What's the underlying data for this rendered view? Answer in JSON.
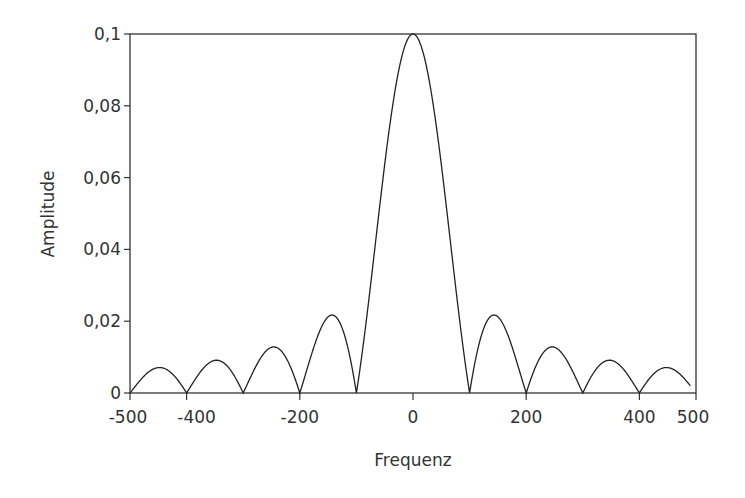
{
  "chart_data": {
    "type": "line",
    "title": "",
    "xlabel": "Frequenz",
    "ylabel": "Amplitude",
    "xlim": [
      -500,
      500
    ],
    "ylim": [
      0,
      0.1
    ],
    "grid": false,
    "legend": null,
    "x_ticks": [
      -500,
      -400,
      -200,
      0,
      200,
      400,
      500
    ],
    "x_tick_labels": [
      "-500",
      "-400",
      "-200",
      "0",
      "200",
      "400",
      "500"
    ],
    "y_ticks": [
      0,
      0.02,
      0.04,
      0.06,
      0.08,
      0.1
    ],
    "y_tick_labels": [
      "0",
      "0,02",
      "0,04",
      "0,06",
      "0,08",
      "0,1"
    ],
    "function": "0.1*|sinc(f/100)|",
    "zeros": [
      -400,
      -300,
      -200,
      -100,
      100,
      200,
      300,
      400
    ],
    "series": [
      {
        "name": "Amplitude",
        "x": [
          -500,
          -450,
          -400,
          -350,
          -300,
          -250,
          -200,
          -143,
          -100,
          -50,
          0,
          50,
          100,
          143,
          200,
          250,
          300,
          350,
          400,
          450,
          490
        ],
        "values": [
          0,
          0.0105,
          0,
          0.0118,
          0,
          0.0145,
          0,
          0.023,
          0,
          0.0636,
          0.1,
          0.0636,
          0,
          0.023,
          0,
          0.0145,
          0,
          0.0118,
          0,
          0.0105,
          0.004
        ]
      }
    ],
    "x_end": 490
  }
}
